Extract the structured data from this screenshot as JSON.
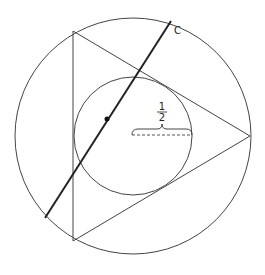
{
  "diagram": {
    "line_label": "C",
    "radius_label": {
      "numerator": "1",
      "denominator": "2"
    },
    "inner_radius_value": 0.5,
    "shapes": [
      "outer-circle",
      "equilateral-triangle",
      "inner-circle",
      "line-c",
      "point-on-line-c",
      "radius-brace"
    ],
    "colors": {
      "stroke": "#444444",
      "line_c": "#222222",
      "background": "#ffffff"
    }
  }
}
